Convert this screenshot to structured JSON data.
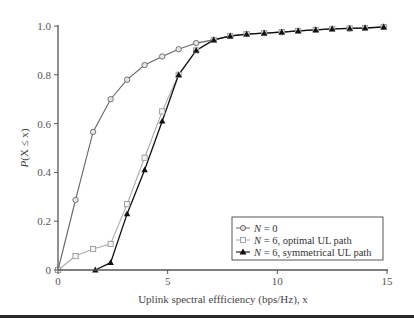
{
  "chart_data": {
    "type": "line",
    "title": "",
    "xlabel": "Uplink spectral effficiency (bps/Hz), x",
    "ylabel": "P(X ≤ x)",
    "xlim": [
      0,
      15
    ],
    "ylim": [
      0,
      1.0
    ],
    "xticks": [
      0,
      5,
      10,
      15
    ],
    "xtick_labels": [
      "0",
      "5",
      "10",
      "15"
    ],
    "yticks": [
      0,
      0.2,
      0.4,
      0.6,
      0.8,
      1.0
    ],
    "ytick_labels": [
      "0",
      "0.2",
      "0.4",
      "0.6",
      "0.8",
      "1.0"
    ],
    "grid": false,
    "legend_position": "lower right",
    "series": [
      {
        "name": "N = 0",
        "marker": "circle",
        "color": "#666666",
        "x": [
          0,
          0.8,
          1.6,
          2.4,
          3.15,
          3.95,
          4.75,
          5.5,
          6.3,
          7.1,
          7.85,
          8.6,
          9.4,
          10.2,
          10.95,
          11.75,
          12.5,
          13.3,
          14.0,
          14.85
        ],
        "y": [
          0,
          0.287,
          0.566,
          0.7,
          0.78,
          0.84,
          0.875,
          0.905,
          0.93,
          0.943,
          0.959,
          0.967,
          0.971,
          0.975,
          0.98,
          0.984,
          0.988,
          0.99,
          0.992,
          0.996
        ]
      },
      {
        "name": "N = 6, optimal UL path",
        "marker": "square",
        "color": "#aaaaaa",
        "x": [
          0,
          0.8,
          1.6,
          2.4,
          3.15,
          3.95,
          4.75,
          5.5,
          6.3,
          7.1,
          7.85,
          8.6,
          9.4,
          10.2,
          10.95,
          11.75,
          12.5,
          13.3,
          14.0,
          14.85
        ],
        "y": [
          0,
          0.057,
          0.086,
          0.107,
          0.27,
          0.46,
          0.65,
          0.8,
          0.9,
          0.943,
          0.959,
          0.967,
          0.971,
          0.975,
          0.98,
          0.984,
          0.988,
          0.99,
          0.992,
          0.996
        ]
      },
      {
        "name": "N = 6, symmetrical UL path",
        "marker": "triangle",
        "color": "#111111",
        "x": [
          1.7,
          2.4,
          3.15,
          3.95,
          4.75,
          5.5,
          6.3,
          7.1,
          7.85,
          8.6,
          9.4,
          10.2,
          10.95,
          11.75,
          12.5,
          13.3,
          14.0,
          14.85
        ],
        "y": [
          0,
          0.03,
          0.23,
          0.41,
          0.61,
          0.8,
          0.9,
          0.943,
          0.959,
          0.967,
          0.971,
          0.975,
          0.98,
          0.984,
          0.988,
          0.99,
          0.992,
          0.996
        ]
      }
    ]
  },
  "legend": {
    "items": [
      {
        "prefix": "N",
        "text": " = 0"
      },
      {
        "prefix": "N",
        "text": " = 6, optimal UL path"
      },
      {
        "prefix": "N",
        "text": " = 6, symmetrical UL path"
      }
    ]
  },
  "axes": {
    "ylabel_italic": "P",
    "ylabel_rest": "(X ≤ x)",
    "xlabel": "Uplink spectral effficiency (bps/Hz), x"
  }
}
